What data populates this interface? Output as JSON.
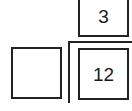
{
  "diagram": {
    "boxes": [
      {
        "id": "top",
        "label": "3"
      },
      {
        "id": "left",
        "label": ""
      },
      {
        "id": "right",
        "label": "12"
      }
    ],
    "bracket": {
      "shape": "L-corner",
      "position": "separating top box from right box, and left box from right box"
    },
    "colors": {
      "stroke": "#222222",
      "background": "#ffffff",
      "text": "#1a1a1a"
    }
  }
}
